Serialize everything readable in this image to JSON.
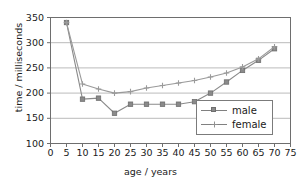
{
  "chart_data": {
    "type": "line",
    "title": "",
    "xlabel": "age / years",
    "ylabel": "time / milliseconds",
    "xlim": [
      0,
      75
    ],
    "ylim": [
      100,
      350
    ],
    "xticks": [
      0,
      5,
      10,
      15,
      20,
      25,
      30,
      35,
      40,
      45,
      50,
      55,
      60,
      65,
      70,
      75
    ],
    "yticks": [
      100,
      150,
      200,
      250,
      300,
      350
    ],
    "grid": "horizontal",
    "legend_position": "inside-lower-right",
    "x": [
      5,
      10,
      15,
      20,
      25,
      30,
      35,
      40,
      45,
      50,
      55,
      60,
      65,
      70
    ],
    "series": [
      {
        "name": "male",
        "marker": "square",
        "color": "#8a8a8a",
        "values": [
          340,
          188,
          190,
          160,
          178,
          178,
          178,
          178,
          183,
          200,
          222,
          245,
          265,
          288
        ]
      },
      {
        "name": "female",
        "marker": "cross",
        "color": "#9a9a9a",
        "values": [
          340,
          218,
          208,
          200,
          203,
          210,
          215,
          220,
          225,
          232,
          240,
          252,
          268,
          292
        ]
      }
    ]
  },
  "legend": {
    "items": [
      {
        "label": "male"
      },
      {
        "label": "female"
      }
    ]
  },
  "colors": {
    "axis": "#6e6e6e",
    "grid": "#b3b3b3",
    "text": "#1a1a1a",
    "plot_background": "#ffffff"
  }
}
